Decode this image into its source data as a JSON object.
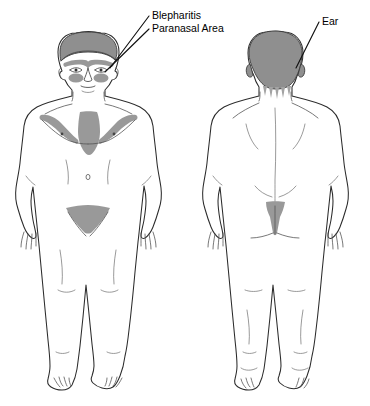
{
  "figure": {
    "background_color": "#ffffff",
    "shading_color": "#999999",
    "outline_color": "#2b2b2b",
    "views": [
      {
        "name": "anterior",
        "label": "Front view"
      },
      {
        "name": "posterior",
        "label": "Back view"
      }
    ]
  },
  "callouts": [
    {
      "id": "blepharitis",
      "text": "Blepharitis",
      "target_view": "anterior",
      "target_region": "eyelid-margin"
    },
    {
      "id": "paranasal",
      "text": "Paranasal Area",
      "target_view": "anterior",
      "target_region": "nasolabial-fold"
    },
    {
      "id": "ear",
      "text": "Ear",
      "target_view": "posterior",
      "target_region": "retroauricular-scalp"
    }
  ],
  "affected_regions": {
    "anterior": [
      "scalp",
      "eyebrows-and-eyelids",
      "paranasal-nasolabial-folds",
      "presternal-chest",
      "inframammary-axillary-folds",
      "pubic-groin"
    ],
    "posterior": [
      "scalp-occiput",
      "retroauricular",
      "posterior-hairline",
      "gluteal-cleft"
    ]
  }
}
